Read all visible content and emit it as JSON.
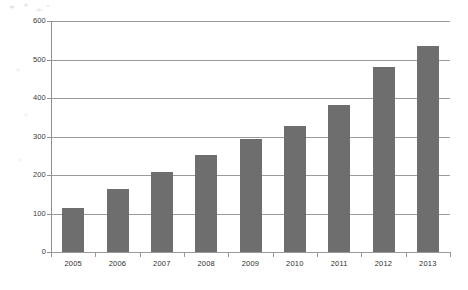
{
  "chart_data": {
    "type": "bar",
    "title": "",
    "subtitle": "",
    "xlabel": "",
    "ylabel": "",
    "categories": [
      "2005",
      "2006",
      "2007",
      "2008",
      "2009",
      "2010",
      "2011",
      "2012",
      "2013"
    ],
    "values": [
      115,
      163,
      208,
      252,
      293,
      327,
      382,
      480,
      535
    ],
    "series": [
      {
        "name": "",
        "values": [
          115,
          163,
          208,
          252,
          293,
          327,
          382,
          480,
          535
        ],
        "color": "#6e6e6e"
      }
    ],
    "ylim": [
      0,
      600
    ],
    "y_ticks": [
      0,
      100,
      200,
      300,
      400,
      500,
      600
    ],
    "y_tick_labels": [
      "0",
      "100",
      "200",
      "300",
      "400",
      "500",
      "600"
    ],
    "grid": true,
    "grid_axis": "y",
    "legend": false,
    "legend_position": "none",
    "annotations": [],
    "colors": {
      "bar": "#6e6e6e",
      "gridline": "#9a9a9a",
      "axis": "#8f8f8f",
      "tick_label": "#2f2f2f",
      "background": "#ffffff"
    }
  }
}
